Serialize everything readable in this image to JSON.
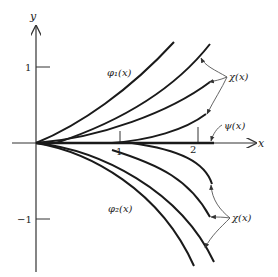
{
  "figure": {
    "axes": {
      "x_label": "x",
      "y_label": "y",
      "x_ticks": [
        {
          "value": "1",
          "label": "1"
        },
        {
          "value": "2",
          "label": "2"
        }
      ],
      "y_ticks": [
        {
          "value": "1",
          "label": "1"
        },
        {
          "value": "-1",
          "label": "−1"
        }
      ]
    },
    "labels": {
      "phi1": "φ₁(x)",
      "phi2": "φ₂(x)",
      "psi": "ψ(x)",
      "chi_upper": "χ(x)",
      "chi_lower": "χ(x)"
    },
    "colors": {
      "curve": "#1a1a1a",
      "axis": "#333333",
      "annotation": "#555555",
      "background": "#ffffff"
    }
  }
}
